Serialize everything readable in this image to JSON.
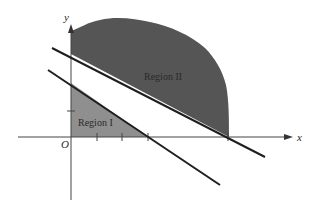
{
  "diagram": {
    "type": "linear-programming-regions",
    "axes": {
      "x_label": "x",
      "y_label": "y",
      "origin_label": "O"
    },
    "regions": [
      {
        "name": "Region I",
        "label": "Region I",
        "shade": "light",
        "color": "#8c8c8c"
      },
      {
        "name": "Region II",
        "label": "Region II",
        "shade": "dark",
        "color": "#555555"
      }
    ],
    "lines": [
      {
        "name": "upper-boundary-line"
      },
      {
        "name": "lower-boundary-line"
      }
    ],
    "x_ticks": 4,
    "y_ticks": 1
  }
}
